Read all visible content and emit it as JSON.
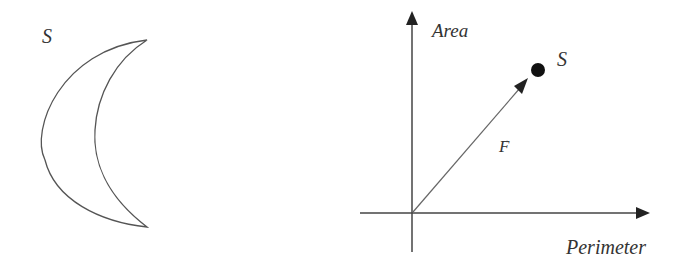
{
  "left_figure": {
    "shape_label": "S",
    "shape": "crescent",
    "stroke_color": "#555555"
  },
  "right_figure": {
    "y_axis_label": "Area",
    "x_axis_label": "Perimeter",
    "point_label": "S",
    "vector_label": "F",
    "vector_accent": "→",
    "axis_color": "#444444",
    "point_color": "#111111"
  }
}
